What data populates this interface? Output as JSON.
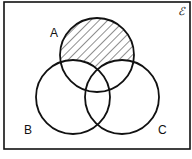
{
  "diagram": {
    "type": "venn",
    "universal_set_symbol": "ℰ",
    "sets": [
      {
        "label": "A",
        "cx": 97,
        "cy": 55,
        "r": 37,
        "label_x": 50,
        "label_y": 37
      },
      {
        "label": "B",
        "cx": 73,
        "cy": 97,
        "r": 37,
        "label_x": 24,
        "label_y": 134
      },
      {
        "label": "C",
        "cx": 122,
        "cy": 97,
        "r": 37,
        "label_x": 158,
        "label_y": 134
      }
    ],
    "shaded_region": "A only (A ∩ B' ∩ C')",
    "stroke_color": "#111111",
    "background_color": "#ffffff"
  }
}
